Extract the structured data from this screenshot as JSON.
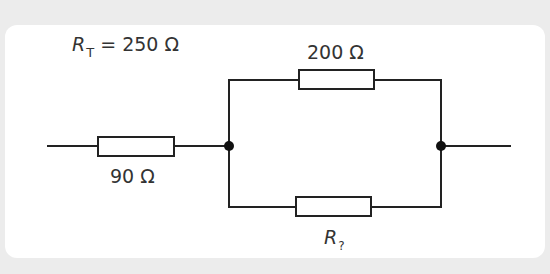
{
  "diagram": {
    "type": "circuit",
    "total_resistance": {
      "symbol": "R",
      "subscript": "T",
      "equals": " = ",
      "value": "250 Ω"
    },
    "resistors": [
      {
        "id": "r1",
        "label": "90 Ω",
        "position": "series-left"
      },
      {
        "id": "r2",
        "label": "200 Ω",
        "position": "parallel-top"
      },
      {
        "id": "r3",
        "symbol": "R",
        "subscript": "?",
        "position": "parallel-bottom"
      }
    ],
    "junctions": [
      {
        "id": "left-junction"
      },
      {
        "id": "right-junction"
      }
    ],
    "colors": {
      "background": "#ececec",
      "card": "#ffffff",
      "wire": "#222222",
      "text": "#333333"
    }
  }
}
